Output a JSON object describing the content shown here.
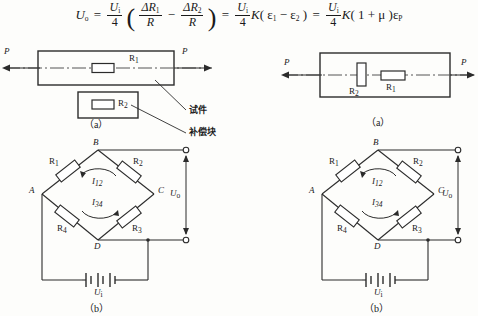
{
  "formula": {
    "lhs": "U",
    "lhs_sub": "o",
    "eq1": "=",
    "f1_num": "U",
    "f1_num_sub": "i",
    "f1_den": "4",
    "paren_open": "(",
    "f2_num": "ΔR",
    "f2_num_sub": "1",
    "f2_den": "R",
    "minus": "−",
    "f3_num": "ΔR",
    "f3_num_sub": "2",
    "f3_den": "R",
    "paren_close": ")",
    "eq2": "=",
    "f4_num": "U",
    "f4_num_sub": "i",
    "f4_den": "4",
    "k1": "K",
    "eps_group1": "( ε",
    "eps1_sub": "1",
    "minus2": " − ",
    "eps2": "ε",
    "eps2_sub": "2",
    "close1": " )",
    "eq3": "=",
    "f5_num": "U",
    "f5_num_sub": "i",
    "f5_den": "4",
    "k2": "K",
    "mu_group": "( 1 + μ )",
    "epsP": "ε",
    "epsP_sub": "P"
  },
  "fig_a_left": {
    "caption": "（a）",
    "force_left": "P",
    "force_right": "P",
    "gauge_label": "R",
    "gauge_sub": "1",
    "comp_label": "R",
    "comp_sub": "2",
    "callout_specimen": "试件",
    "callout_compblock": "补偿块"
  },
  "fig_a_right": {
    "caption": "（a）",
    "force_left": "P",
    "force_right": "P",
    "gauge_v_label": "R",
    "gauge_v_sub": "2",
    "gauge_h_label": "R",
    "gauge_h_sub": "1"
  },
  "bridge_left": {
    "caption": "（b）",
    "node_a": "A",
    "node_b": "B",
    "node_c": "C",
    "node_d": "D",
    "r1": "R",
    "r1_sub": "1",
    "r2": "R",
    "r2_sub": "2",
    "r3": "R",
    "r3_sub": "3",
    "r4": "R",
    "r4_sub": "4",
    "i12": "I",
    "i12_sub": "12",
    "i34": "I",
    "i34_sub": "34",
    "uo": "U",
    "uo_sub": "o",
    "ui": "U",
    "ui_sub": "i"
  },
  "bridge_right": {
    "caption": "（b）",
    "node_a": "A",
    "node_b": "B",
    "node_c": "C",
    "node_d": "D",
    "r1": "R",
    "r1_sub": "1",
    "r2": "R",
    "r2_sub": "2",
    "r3": "R",
    "r3_sub": "3",
    "r4": "R",
    "r4_sub": "4",
    "i12": "I",
    "i12_sub": "12",
    "i34": "I",
    "i34_sub": "34",
    "uo": "U",
    "uo_sub": "o",
    "ui": "U",
    "ui_sub": "i"
  },
  "colors": {
    "ink": "#1a1a1a",
    "paper": "#fdfdfb",
    "rule": "#2b2b2b"
  }
}
